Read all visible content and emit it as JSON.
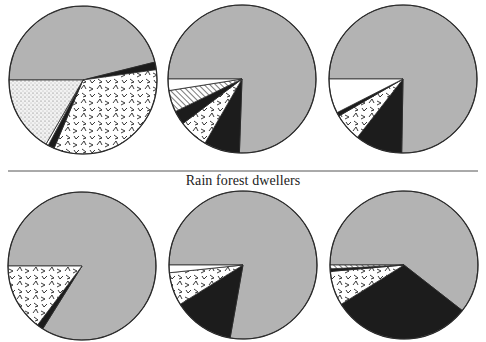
{
  "figure": {
    "caption": "Rain forest dwellers",
    "colors": {
      "gray": "#b3b3b3",
      "black": "#1c1c1c",
      "white": "#ffffff",
      "outline": "#2a2a2a",
      "separator": "#555555"
    }
  },
  "chart_data": {
    "type": "pie",
    "title": "",
    "annotations": [
      "Rain forest dwellers"
    ],
    "legend": [],
    "patterns": [
      "gray",
      "black",
      "zigzag",
      "dotted",
      "hatched",
      "white"
    ],
    "charts": [
      {
        "row": "top",
        "position": 1,
        "cx": 83,
        "cy": 80,
        "r": 74,
        "slices": [
          {
            "pattern": "gray",
            "start": 180,
            "end": 346,
            "percent": 46.1
          },
          {
            "pattern": "black",
            "start": 346,
            "end": 352,
            "percent": 1.7
          },
          {
            "pattern": "zigzag",
            "start": 352,
            "end": 473,
            "percent": 33.6
          },
          {
            "pattern": "black",
            "start": 473,
            "end": 478,
            "percent": 1.4
          },
          {
            "pattern": "white",
            "start": 478,
            "end": 480,
            "percent": 0.6
          },
          {
            "pattern": "dotted",
            "start": 480,
            "end": 540,
            "percent": 16.7
          }
        ]
      },
      {
        "row": "top",
        "position": 2,
        "cx": 242,
        "cy": 79,
        "r": 74,
        "slices": [
          {
            "pattern": "gray",
            "start": 180,
            "end": 452,
            "percent": 75.6
          },
          {
            "pattern": "black",
            "start": 452,
            "end": 480,
            "percent": 7.8
          },
          {
            "pattern": "zigzag",
            "start": 480,
            "end": 503,
            "percent": 6.4
          },
          {
            "pattern": "black",
            "start": 503,
            "end": 514,
            "percent": 3.1
          },
          {
            "pattern": "hatched",
            "start": 514,
            "end": 531,
            "percent": 4.7
          },
          {
            "pattern": "white",
            "start": 531,
            "end": 540,
            "percent": 2.5
          }
        ]
      },
      {
        "row": "top",
        "position": 3,
        "cx": 403,
        "cy": 79,
        "r": 74,
        "slices": [
          {
            "pattern": "gray",
            "start": 180,
            "end": 451,
            "percent": 75.3
          },
          {
            "pattern": "black",
            "start": 451,
            "end": 488,
            "percent": 10.3
          },
          {
            "pattern": "zigzag",
            "start": 488,
            "end": 510,
            "percent": 6.1
          },
          {
            "pattern": "black",
            "start": 510,
            "end": 513,
            "percent": 0.8
          },
          {
            "pattern": "white",
            "start": 513,
            "end": 540,
            "percent": 7.5
          }
        ]
      },
      {
        "row": "bottom",
        "position": 1,
        "cx": 82,
        "cy": 266,
        "r": 74,
        "slices": [
          {
            "pattern": "gray",
            "start": 180,
            "end": 482,
            "percent": 83.9
          },
          {
            "pattern": "black",
            "start": 482,
            "end": 487,
            "percent": 1.4
          },
          {
            "pattern": "zigzag",
            "start": 487,
            "end": 540,
            "percent": 14.7
          }
        ]
      },
      {
        "row": "bottom",
        "position": 2,
        "cx": 243,
        "cy": 265,
        "r": 74,
        "slices": [
          {
            "pattern": "gray",
            "start": 180,
            "end": 460,
            "percent": 77.8
          },
          {
            "pattern": "black",
            "start": 460,
            "end": 508,
            "percent": 13.3
          },
          {
            "pattern": "zigzag",
            "start": 508,
            "end": 534,
            "percent": 7.2
          },
          {
            "pattern": "white",
            "start": 534,
            "end": 540,
            "percent": 1.7
          }
        ]
      },
      {
        "row": "bottom",
        "position": 3,
        "cx": 404,
        "cy": 265,
        "r": 74,
        "slices": [
          {
            "pattern": "gray",
            "start": 180,
            "end": 398,
            "percent": 60.6
          },
          {
            "pattern": "black",
            "start": 398,
            "end": 508,
            "percent": 30.6
          },
          {
            "pattern": "zigzag",
            "start": 508,
            "end": 535,
            "percent": 7.5
          },
          {
            "pattern": "black",
            "start": 535,
            "end": 537,
            "percent": 0.6
          },
          {
            "pattern": "hatched",
            "start": 537,
            "end": 540,
            "percent": 0.8
          }
        ]
      }
    ],
    "separator": {
      "y": 171,
      "x1": 8,
      "x2": 478
    }
  }
}
